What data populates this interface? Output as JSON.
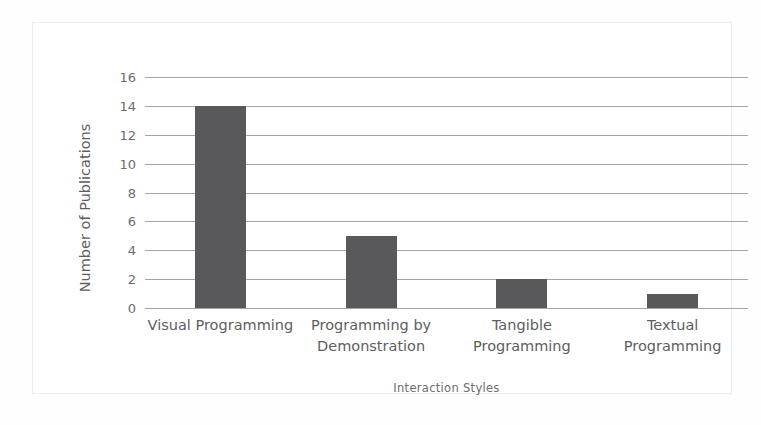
{
  "chart_data": {
    "type": "bar",
    "title": "",
    "xlabel": "Interaction Styles",
    "ylabel": "Number of Publications",
    "categories": [
      "Visual Programming",
      "Programming by Demonstration",
      "Tangible Programming",
      "Textual Programming"
    ],
    "category_lines": [
      [
        "Visual Programming"
      ],
      [
        "Programming by",
        "Demonstration"
      ],
      [
        "Tangible",
        "Programming"
      ],
      [
        "Textual",
        "Programming"
      ]
    ],
    "values": [
      14,
      5,
      2,
      1
    ],
    "ylim": [
      0,
      16
    ],
    "ytick_step": 2,
    "yticks": [
      0,
      2,
      4,
      6,
      8,
      10,
      12,
      14,
      16
    ],
    "ytick_labels": [
      "0",
      "2",
      "4",
      "6",
      "8",
      "10",
      "12",
      "14",
      "16"
    ],
    "grid": true,
    "grid_axis": "y",
    "legend": false,
    "legend_position": "none",
    "bar_color": "#59595b",
    "gridline_color": "#a6a6a6",
    "plot_background": "#ffffff",
    "frame_color": "#ededed",
    "text_color": "#5e5e5e"
  }
}
